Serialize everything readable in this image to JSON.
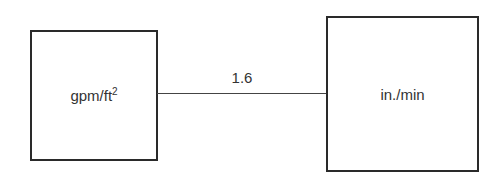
{
  "diagram": {
    "nodes": [
      {
        "id": "left",
        "label": "gpm/ft",
        "superscript": "2"
      },
      {
        "id": "right",
        "label": "in./min"
      }
    ],
    "edges": [
      {
        "from": "left",
        "to": "right",
        "label": "1.6"
      }
    ]
  }
}
